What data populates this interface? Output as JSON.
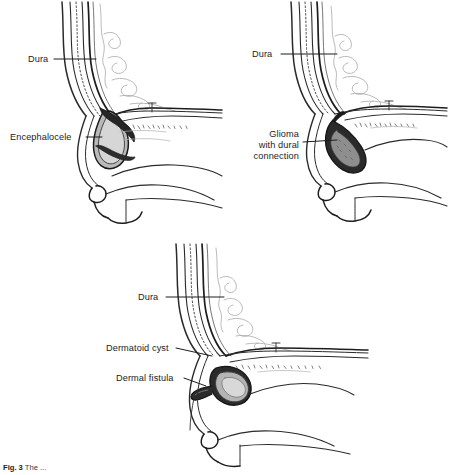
{
  "figure": {
    "id": "Fig. 3",
    "caption_visible": "Fig. 3  The ...",
    "caption_prefix": "Fig. 3",
    "caption_body": "  The ...",
    "background_color": "#ffffff",
    "ink_color": "#1c1c1c",
    "line_color": "#222222",
    "faint_line_color": "#9a9a9a",
    "mass_fill_dark": "#2b2b2b",
    "mass_fill_mid": "#8f8f8f",
    "mass_fill_light": "#c9c9c9"
  },
  "panels": [
    {
      "key": "encephalocele",
      "name": "panel-encephalocele",
      "position": "top-left",
      "labels": [
        {
          "key": "dura",
          "text": "Dura",
          "anchor": "start",
          "x": 28,
          "y": 62
        },
        {
          "key": "encephalocele",
          "text": "Encephalocele",
          "anchor": "start",
          "x": 10,
          "y": 140
        }
      ]
    },
    {
      "key": "glioma",
      "name": "panel-glioma",
      "position": "top-right",
      "labels": [
        {
          "key": "dura",
          "text": "Dura",
          "anchor": "start",
          "x": 27,
          "y": 57
        },
        {
          "key": "glioma-line-1",
          "text": "Glioma",
          "anchor": "end",
          "x": 74,
          "y": 137
        },
        {
          "key": "glioma-line-2",
          "text": "with dural",
          "anchor": "end",
          "x": 74,
          "y": 148
        },
        {
          "key": "glioma-line-3",
          "text": "connection",
          "anchor": "end",
          "x": 74,
          "y": 159
        }
      ]
    },
    {
      "key": "dermoid",
      "name": "panel-dermoid",
      "position": "bottom-center",
      "labels": [
        {
          "key": "dura",
          "text": "Dura",
          "anchor": "start",
          "x": 58,
          "y": 60
        },
        {
          "key": "dermatoid-cyst",
          "text": "Dermatoid cyst",
          "anchor": "start",
          "x": 26,
          "y": 111
        },
        {
          "key": "dermal-fistula",
          "text": "Dermal fistula",
          "anchor": "start",
          "x": 36,
          "y": 141
        }
      ]
    }
  ],
  "anatomy_legend": {
    "structures": [
      "cranial vault",
      "dura mater",
      "brain gyri",
      "cribriform plate / skull base",
      "nasal bone",
      "nasal dorsum",
      "nasal tip",
      "upper lip",
      "hard palate"
    ]
  }
}
